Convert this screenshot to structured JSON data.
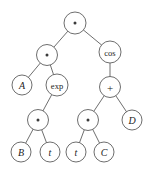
{
  "diagram": {
    "type": "expression-tree",
    "background_color": "#ffffff",
    "stroke_color": "#5d5d5d",
    "text_color": "#1c1c1c",
    "node_radius": 10.5,
    "leaf_radius": 9.5,
    "nodes": [
      {
        "id": "n0",
        "label": "*",
        "glyph": "operator-multiply",
        "kind": "operator",
        "x": 75,
        "y": 23,
        "r": 11,
        "style": "dot"
      },
      {
        "id": "n1",
        "label": "*",
        "glyph": "operator-multiply",
        "kind": "operator",
        "x": 47,
        "y": 55,
        "r": 10.5,
        "style": "dot"
      },
      {
        "id": "n2",
        "label": "cos",
        "glyph": "function-cos",
        "kind": "function",
        "x": 110,
        "y": 52,
        "r": 11,
        "style": "text"
      },
      {
        "id": "n3",
        "label": "A",
        "glyph": "variable-a",
        "kind": "variable",
        "x": 22,
        "y": 85,
        "r": 10,
        "style": "text"
      },
      {
        "id": "n4",
        "label": "exp",
        "glyph": "function-exp",
        "kind": "function",
        "x": 57,
        "y": 85,
        "r": 11,
        "style": "text"
      },
      {
        "id": "n5",
        "label": "+",
        "glyph": "operator-plus",
        "kind": "operator",
        "x": 110,
        "y": 87,
        "r": 10.5,
        "style": "text"
      },
      {
        "id": "n6",
        "label": "*",
        "glyph": "operator-multiply",
        "kind": "operator",
        "x": 38,
        "y": 120,
        "r": 10.5,
        "style": "dot"
      },
      {
        "id": "n7",
        "label": "*",
        "glyph": "operator-multiply",
        "kind": "operator",
        "x": 88,
        "y": 120,
        "r": 10.5,
        "style": "dot"
      },
      {
        "id": "n8",
        "label": "D",
        "glyph": "variable-d",
        "kind": "variable",
        "x": 132,
        "y": 120,
        "r": 10,
        "style": "text"
      },
      {
        "id": "n9",
        "label": "B",
        "glyph": "variable-b",
        "kind": "variable",
        "x": 21,
        "y": 152,
        "r": 10,
        "style": "text"
      },
      {
        "id": "n10",
        "label": "t",
        "glyph": "variable-t",
        "kind": "variable",
        "x": 50,
        "y": 152,
        "r": 10,
        "style": "text"
      },
      {
        "id": "n11",
        "label": "t",
        "glyph": "variable-t",
        "kind": "variable",
        "x": 76,
        "y": 152,
        "r": 10,
        "style": "text"
      },
      {
        "id": "n12",
        "label": "C",
        "glyph": "variable-c",
        "kind": "variable",
        "x": 104,
        "y": 152,
        "r": 10,
        "style": "text"
      }
    ],
    "edges": [
      {
        "from": "n0",
        "to": "n1"
      },
      {
        "from": "n0",
        "to": "n2"
      },
      {
        "from": "n1",
        "to": "n3"
      },
      {
        "from": "n1",
        "to": "n4"
      },
      {
        "from": "n2",
        "to": "n5"
      },
      {
        "from": "n4",
        "to": "n6"
      },
      {
        "from": "n5",
        "to": "n7"
      },
      {
        "from": "n5",
        "to": "n8"
      },
      {
        "from": "n6",
        "to": "n9"
      },
      {
        "from": "n6",
        "to": "n10"
      },
      {
        "from": "n7",
        "to": "n11"
      },
      {
        "from": "n7",
        "to": "n12"
      }
    ]
  }
}
